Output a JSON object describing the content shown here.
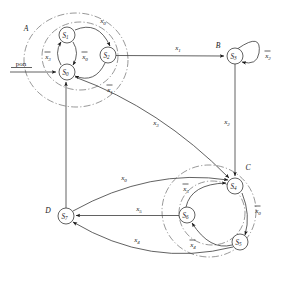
{
  "figure": {
    "kind": "state-transition-diagram",
    "title": "",
    "caption": "",
    "reset_label": "pon",
    "stroke_color": "#3a3a3a",
    "cluster_color": "#6b6b6b",
    "background": "#ffffff"
  },
  "clusters": [
    {
      "id": "A",
      "label": "A",
      "label_x": 26,
      "label_y": 28,
      "cx": 76,
      "cy": 60,
      "rx": 52,
      "ry": 47
    },
    {
      "id": "B",
      "label": "B",
      "label_x": 218,
      "label_y": 47,
      "cx": 0,
      "cy": 0,
      "rx": 0,
      "ry": 0
    },
    {
      "id": "C",
      "label": "C",
      "label_x": 248,
      "label_y": 168,
      "cx": 209,
      "cy": 211,
      "rx": 46,
      "ry": 46
    },
    {
      "id": "D",
      "label": "D",
      "label_x": 48,
      "label_y": 211,
      "cx": 0,
      "cy": 0,
      "rx": 0,
      "ry": 0
    }
  ],
  "nodes": [
    {
      "id": "S0",
      "label": "S",
      "sub": "0",
      "x": 67,
      "y": 72,
      "r": 8.0,
      "cluster": "A"
    },
    {
      "id": "S1",
      "label": "S",
      "sub": "1",
      "x": 67,
      "y": 35,
      "r": 8.0,
      "cluster": "A"
    },
    {
      "id": "S2",
      "label": "S",
      "sub": "2",
      "x": 108,
      "y": 55,
      "r": 8.0,
      "cluster": "A"
    },
    {
      "id": "S3",
      "label": "S",
      "sub": "3",
      "x": 235,
      "y": 56,
      "r": 8.0,
      "cluster": "B"
    },
    {
      "id": "S4",
      "label": "S",
      "sub": "4",
      "x": 235,
      "y": 186,
      "r": 8.0,
      "cluster": "C"
    },
    {
      "id": "S5",
      "label": "S",
      "sub": "5",
      "x": 240,
      "y": 242,
      "r": 8.0,
      "cluster": "C"
    },
    {
      "id": "S6",
      "label": "S",
      "sub": "6",
      "x": 187,
      "y": 215,
      "r": 8.0,
      "cluster": "C"
    },
    {
      "id": "S7",
      "label": "S",
      "sub": "7",
      "x": 66,
      "y": 216,
      "r": 8.0,
      "cluster": "D"
    }
  ],
  "edges": [
    {
      "id": "e-reset",
      "from": "pon",
      "to": "S0",
      "label": "",
      "sub": "",
      "overbar": false
    },
    {
      "id": "e1",
      "from": "S1",
      "to": "S2",
      "label": "x",
      "sub": "0",
      "overbar": false,
      "lx": 103,
      "ly": 23
    },
    {
      "id": "e2",
      "from": "S2",
      "to": "S0",
      "label": "x",
      "sub": "1",
      "overbar": true,
      "lx": 110,
      "ly": 90
    },
    {
      "id": "e3",
      "from": "S0",
      "to": "S1",
      "label": "x",
      "sub": "3",
      "overbar": true,
      "lx": 48,
      "ly": 58
    },
    {
      "id": "e4",
      "from": "S1",
      "to": "S0",
      "label": "x",
      "sub": "0",
      "overbar": true,
      "lx": 85,
      "ly": 58
    },
    {
      "id": "e5",
      "from": "S2",
      "to": "S3",
      "label": "x",
      "sub": "1",
      "overbar": false,
      "lx": 178,
      "ly": 50
    },
    {
      "id": "e6",
      "from": "S3",
      "to": "S3",
      "label": "x",
      "sub": "2",
      "overbar": true,
      "lx": 268,
      "ly": 58
    },
    {
      "id": "e7",
      "from": "S3",
      "to": "S4",
      "label": "x",
      "sub": "2",
      "overbar": false,
      "lx": 227,
      "ly": 124
    },
    {
      "id": "e8",
      "from": "S0",
      "to": "S4",
      "label": "x",
      "sub": "3",
      "overbar": false,
      "lx": 156,
      "ly": 125
    },
    {
      "id": "e9",
      "from": "S4",
      "to": "S5",
      "label": "x",
      "sub": "0",
      "overbar": true,
      "lx": 258,
      "ly": 213
    },
    {
      "id": "e10",
      "from": "S5",
      "to": "S6",
      "label": "x",
      "sub": "4",
      "overbar": true,
      "lx": 193,
      "ly": 247
    },
    {
      "id": "e11",
      "from": "S6",
      "to": "S4",
      "label": "x",
      "sub": "5",
      "overbar": true,
      "lx": 186,
      "ly": 191
    },
    {
      "id": "e12",
      "from": "S7",
      "to": "S4",
      "label": "x",
      "sub": "0",
      "overbar": false,
      "lx": 124,
      "ly": 180
    },
    {
      "id": "e13",
      "from": "S6",
      "to": "S7",
      "label": "x",
      "sub": "5",
      "overbar": false,
      "lx": 139,
      "ly": 211
    },
    {
      "id": "e14",
      "from": "S5",
      "to": "S7",
      "label": "x",
      "sub": "4",
      "overbar": false,
      "lx": 137,
      "ly": 242
    },
    {
      "id": "e15",
      "from": "S7",
      "to": "S0",
      "label": "",
      "sub": "",
      "overbar": false
    }
  ]
}
